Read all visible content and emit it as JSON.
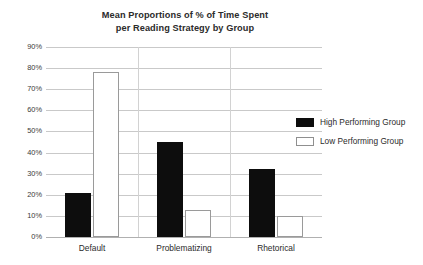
{
  "chart_data": {
    "type": "bar",
    "title": "Mean Proportions of % of Time Spent per Reading Strategy by Group",
    "title_lines": [
      "Mean Proportions of % of Time Spent",
      "per Reading Strategy by Group"
    ],
    "categories": [
      "Default",
      "Problematizing",
      "Rhetorical"
    ],
    "series": [
      {
        "name": "High Performing Group",
        "color": "#0d0d0d",
        "values": [
          21,
          45,
          32
        ]
      },
      {
        "name": "Low Performing Group",
        "color": "#ffffff",
        "values": [
          78,
          13,
          10
        ]
      }
    ],
    "xlabel": "",
    "ylabel": "",
    "ylim": [
      0,
      90
    ],
    "ytick_values": [
      90,
      80,
      70,
      60,
      50,
      40,
      30,
      20,
      10,
      0
    ],
    "ytick_labels": [
      "90%",
      "80%",
      "70%",
      "60%",
      "50%",
      "40%",
      "30%",
      "20%",
      "10%",
      "0%"
    ],
    "grid": true,
    "grid_axis": "y",
    "legend_position": "right"
  },
  "legend": {
    "items": [
      {
        "label": "High Performing Group",
        "swatch": "solid-black-swatch"
      },
      {
        "label": "Low Performing Group",
        "swatch": "outlined-white-swatch"
      }
    ]
  }
}
